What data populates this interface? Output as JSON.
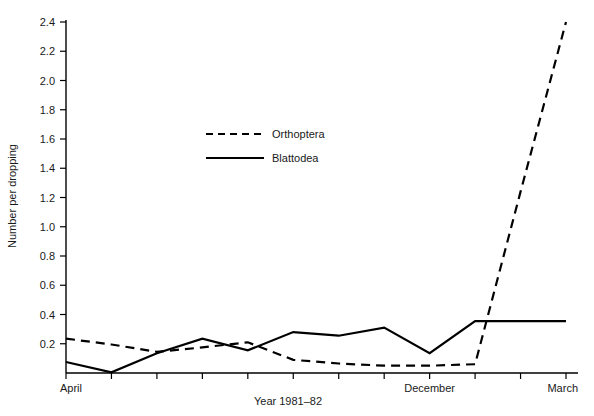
{
  "chart_data": {
    "type": "line",
    "title": "",
    "xlabel": "Year 1981–82",
    "ylabel": "Number per dropping",
    "ylim": [
      0,
      2.4
    ],
    "xlim": [
      0,
      12
    ],
    "grid": false,
    "legend_position": "upper-center-left",
    "y_ticks": [
      "0.2",
      "0.4",
      "0.6",
      "0.8",
      "1.0",
      "1.2",
      "1.4",
      "1.6",
      "1.8",
      "2.0",
      "2.2",
      "2.4"
    ],
    "y_tick_values": [
      0.2,
      0.4,
      0.6,
      0.8,
      1.0,
      1.2,
      1.4,
      1.6,
      1.8,
      2.0,
      2.2,
      2.4
    ],
    "x_tick_labels": [
      "April",
      "",
      "",
      "",
      "",
      "",
      "",
      "",
      "December",
      "",
      "",
      "March"
    ],
    "x_tick_indices": [
      0,
      1,
      2,
      3,
      4,
      5,
      6,
      7,
      8,
      9,
      10,
      11
    ],
    "x_labeled": [
      {
        "index": 0,
        "label": "April"
      },
      {
        "index": 8,
        "label": "December"
      },
      {
        "index": 11,
        "label": "March"
      }
    ],
    "x": [
      0,
      1,
      2,
      3,
      4,
      5,
      6,
      7,
      8,
      9,
      10,
      11
    ],
    "series": [
      {
        "name": "Orthoptera",
        "style": "dashed",
        "color": "#000000",
        "values": [
          0.235,
          0.195,
          0.145,
          0.175,
          0.21,
          0.09,
          0.065,
          0.05,
          0.05,
          0.06,
          1.24,
          2.4
        ]
      },
      {
        "name": "Blattodea",
        "style": "solid",
        "color": "#000000",
        "values": [
          0.075,
          0.005,
          0.135,
          0.235,
          0.155,
          0.28,
          0.255,
          0.31,
          0.135,
          0.355,
          0.355,
          0.355
        ]
      }
    ],
    "legend": [
      {
        "name": "Orthoptera",
        "style": "dashed"
      },
      {
        "name": "Blattodea",
        "style": "solid"
      }
    ]
  }
}
